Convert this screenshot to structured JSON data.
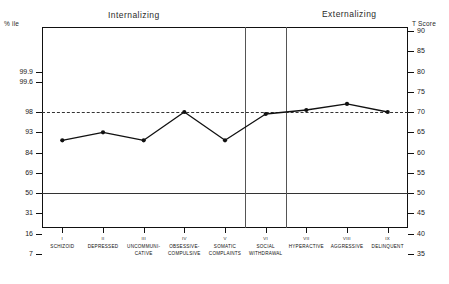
{
  "header": {
    "internalizing_label": "Internalizing",
    "externalizing_label": "Externalizing",
    "left_axis_caption": "% ile",
    "right_axis_caption": "T Score"
  },
  "chart_data": {
    "type": "line",
    "title": "",
    "xlabel": "",
    "ylabel": "T Score",
    "ylim": [
      33,
      92
    ],
    "grid": false,
    "legend": "none",
    "categories": [
      "SCHIZOID",
      "DEPRESSED",
      "UNCOMMUNICATIVE",
      "OBSESSIVE-COMPULSIVE",
      "SOMATIC COMPLAINTS",
      "SOCIAL WITHDRAWAL",
      "HYPERACTIVE",
      "AGGRESSIVE",
      "DELINQUENT"
    ],
    "category_numerals": [
      "I",
      "II",
      "III",
      "IV",
      "V",
      "VI",
      "VII",
      "VIII",
      "IX"
    ],
    "category_lines": [
      [
        "SCHIZOID"
      ],
      [
        "DEPRESSED"
      ],
      [
        "UNCOMMUNI-",
        "CATIVE"
      ],
      [
        "OBSESSIVE-",
        "COMPULSIVE"
      ],
      [
        "SOMATIC",
        "COMPLAINTS"
      ],
      [
        "SOCIAL",
        "WITHDRAWAL"
      ],
      [
        "HYPERACTIVE"
      ],
      [
        "AGGRESSIVE"
      ],
      [
        "DELINQUENT"
      ]
    ],
    "values": [
      63,
      65,
      63,
      70,
      63,
      69.5,
      70.5,
      72,
      70
    ],
    "series": [
      {
        "name": "T Score profile",
        "values": [
          63,
          65,
          63,
          70,
          63,
          69.5,
          70.5,
          72,
          70
        ]
      }
    ],
    "y_axis_right": {
      "label": "T Score",
      "ticks": [
        90,
        85,
        80,
        75,
        70,
        65,
        60,
        55,
        50,
        45,
        40,
        35
      ]
    },
    "y_axis_left": {
      "label": "% ile",
      "ticks": [
        "99.9",
        "99.6",
        "98",
        "93",
        "84",
        "69",
        "50",
        "31",
        "16",
        "7"
      ],
      "tick_tscores": [
        80,
        77.5,
        70,
        65,
        60,
        55,
        50,
        45,
        40,
        35
      ]
    },
    "reference_lines": [
      {
        "name": "clinical-cutoff",
        "tscore": 70,
        "style": "dashed"
      },
      {
        "name": "mean",
        "tscore": 50,
        "style": "solid"
      }
    ],
    "group_dividers_after_category": [
      5,
      6
    ],
    "groups": [
      {
        "name": "Internalizing",
        "categories": [
          "I",
          "II",
          "III",
          "IV",
          "V"
        ]
      },
      {
        "name": "Externalizing",
        "categories": [
          "VII",
          "VIII",
          "IX"
        ]
      }
    ],
    "colors": {
      "line": "#111111",
      "marker": "#111111",
      "frame": "#111111",
      "reference_dashed": "#333333",
      "reference_solid": "#333333",
      "background": "#ffffff"
    }
  }
}
